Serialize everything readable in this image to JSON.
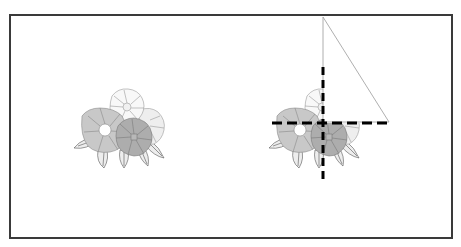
{
  "canvas": {
    "width": 461,
    "height": 247,
    "background": "#ffffff"
  },
  "frame": {
    "x": 10,
    "y": 15,
    "width": 442,
    "height": 223,
    "stroke": "#3a3a3a",
    "stroke_width": 2
  },
  "colors": {
    "petal_white": "#f7f7f7",
    "petal_light": "#e6e6e6",
    "petal_mid": "#c4c4c4",
    "petal_dark": "#a9a9a9",
    "petal_line": "#8a8a8a",
    "leaf_fill": "#ededed",
    "leaf_line": "#555555",
    "guide_line": "#000000",
    "triangle_line": "#9a9a9a"
  },
  "flower_clusters": [
    {
      "id": "original",
      "dx": 0,
      "dy": 0,
      "clipped": false
    },
    {
      "id": "transformed",
      "dx": 195,
      "dy": 0,
      "clipped": true
    }
  ],
  "guides": {
    "vertical": {
      "x": 323,
      "y1": 67,
      "y2": 184,
      "dash": "8 5"
    },
    "horizontal": {
      "y": 123,
      "x1": 272,
      "x2": 390,
      "dash": "10 5"
    }
  },
  "triangle": {
    "points": [
      [
        323,
        17
      ],
      [
        323,
        122
      ],
      [
        389,
        122
      ]
    ]
  }
}
